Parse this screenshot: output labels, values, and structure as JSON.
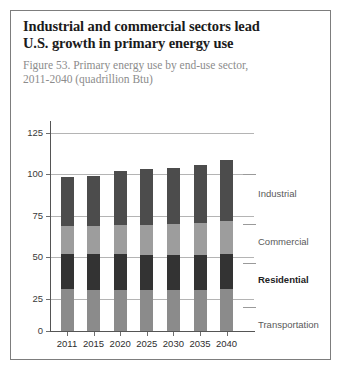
{
  "headline": {
    "line1": "Industrial and commercial sectors lead",
    "line2": "U.S. growth in primary energy use"
  },
  "subtitle": {
    "line1": "Figure 53. Primary energy use by end-use sector,",
    "line2": "2011-2040 (quadrillion Btu)"
  },
  "colors": {
    "industrial": "#4c4c4c",
    "commercial": "#9d9d9d",
    "residential": "#333333",
    "transportation": "#8b8b8b",
    "gridline": "#b4b4b4",
    "axis": "#555555"
  },
  "chart_data": {
    "type": "bar",
    "stacked": true,
    "title": "Figure 53. Primary energy use by end-use sector, 2011-2040 (quadrillion Btu)",
    "xlabel": "",
    "ylabel": "",
    "ylim": [
      0,
      125
    ],
    "yticks": [
      "0",
      "25",
      "50",
      "75",
      "100",
      "125"
    ],
    "grid": true,
    "legend_position": "right-inline",
    "categories": [
      "2011",
      "2015",
      "2020",
      "2025",
      "2030",
      "2035",
      "2040"
    ],
    "series": [
      {
        "name": "Transportation",
        "values": [
          26.5,
          26.0,
          26.0,
          26.0,
          26.0,
          26.0,
          26.5
        ]
      },
      {
        "name": "Residential",
        "values": [
          22.0,
          22.5,
          22.5,
          22.0,
          22.0,
          22.0,
          22.0
        ]
      },
      {
        "name": "Commercial",
        "values": [
          17.5,
          18.0,
          18.5,
          19.0,
          19.5,
          20.0,
          21.0
        ]
      },
      {
        "name": "Industrial",
        "values": [
          31.0,
          31.5,
          34.0,
          35.0,
          35.5,
          36.5,
          38.5
        ]
      }
    ],
    "totals": [
      97.0,
      98.0,
      101.0,
      102.0,
      103.0,
      104.5,
      108.0
    ],
    "units": "quadrillion Btu"
  },
  "legend": [
    {
      "label": "Industrial"
    },
    {
      "label": "Commercial"
    },
    {
      "label": "Residential"
    },
    {
      "label": "Transportation"
    }
  ]
}
